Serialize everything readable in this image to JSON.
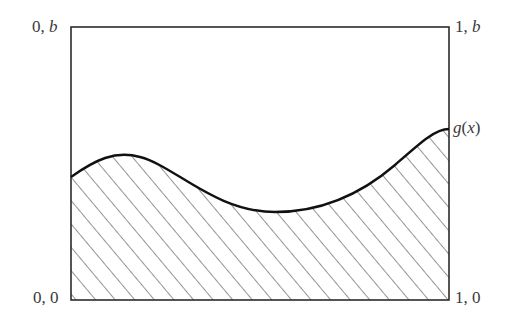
{
  "diagram": {
    "corners": {
      "top_left": {
        "x": "0",
        "sep": ", ",
        "y": "b"
      },
      "top_right": {
        "x": "1",
        "sep": ", ",
        "y": "b"
      },
      "bottom_left": {
        "x": "0",
        "sep": ", ",
        "y": "0"
      },
      "bottom_right": {
        "x": "1",
        "sep": ", ",
        "y": "0"
      }
    },
    "curve_label": {
      "fn": "g",
      "open": "(",
      "arg": "x",
      "close": ")"
    },
    "region_fill": "diagonal hatching under curve",
    "colors": {
      "frame": "#2b2b2b",
      "curve": "#111111",
      "hatch": "#3c3c3c",
      "text": "#3a3a3a"
    }
  }
}
